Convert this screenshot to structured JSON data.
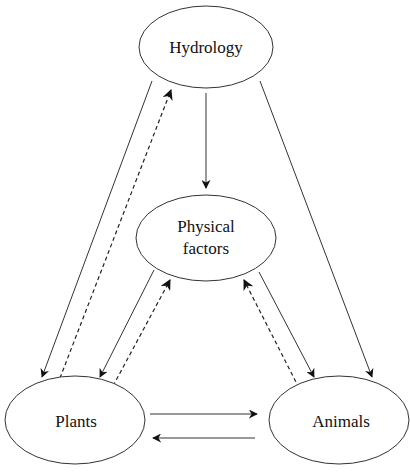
{
  "diagram": {
    "nodes": [
      {
        "id": "hydrology",
        "label": "Hydrology"
      },
      {
        "id": "physical",
        "label_line1": "Physical",
        "label_line2": "factors"
      },
      {
        "id": "plants",
        "label": "Plants"
      },
      {
        "id": "animals",
        "label": "Animals"
      }
    ],
    "edges": [
      {
        "from": "hydrology",
        "to": "physical",
        "style": "solid"
      },
      {
        "from": "hydrology",
        "to": "plants",
        "style": "solid"
      },
      {
        "from": "plants",
        "to": "hydrology",
        "style": "dashed"
      },
      {
        "from": "hydrology",
        "to": "animals",
        "style": "solid"
      },
      {
        "from": "physical",
        "to": "plants",
        "style": "solid"
      },
      {
        "from": "plants",
        "to": "physical",
        "style": "dashed"
      },
      {
        "from": "physical",
        "to": "animals",
        "style": "solid"
      },
      {
        "from": "animals",
        "to": "physical",
        "style": "dashed"
      },
      {
        "from": "plants",
        "to": "animals",
        "style": "solid"
      },
      {
        "from": "animals",
        "to": "plants",
        "style": "solid"
      }
    ]
  }
}
